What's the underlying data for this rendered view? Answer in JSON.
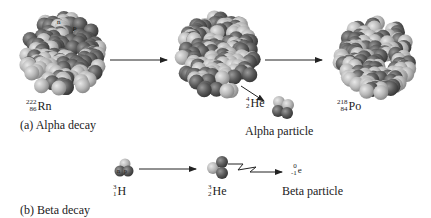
{
  "diagram": {
    "alpha": {
      "caption": "(a) Alpha decay",
      "parent": {
        "mass": "222",
        "atomic": "86",
        "symbol": "Rn"
      },
      "emitted": {
        "mass": "4",
        "atomic": "2",
        "symbol": "He"
      },
      "emitted_label": "Alpha particle",
      "daughter": {
        "mass": "218",
        "atomic": "84",
        "symbol": "Po"
      },
      "nucleon_labels": [
        "n",
        "p"
      ]
    },
    "beta": {
      "caption": "(b) Beta decay",
      "parent": {
        "mass": "3",
        "atomic": "1",
        "symbol": "H"
      },
      "daughter": {
        "mass": "3",
        "atomic": "2",
        "symbol": "He"
      },
      "emitted": {
        "mass": "0",
        "atomic": "-1",
        "symbol": "e"
      },
      "emitted_label": "Beta particle",
      "nucleon_labels": [
        "n",
        "p"
      ]
    },
    "colors": {
      "proton": "#5a5a5a",
      "neutron": "#b8b8b8",
      "arrow": "#222222"
    }
  }
}
